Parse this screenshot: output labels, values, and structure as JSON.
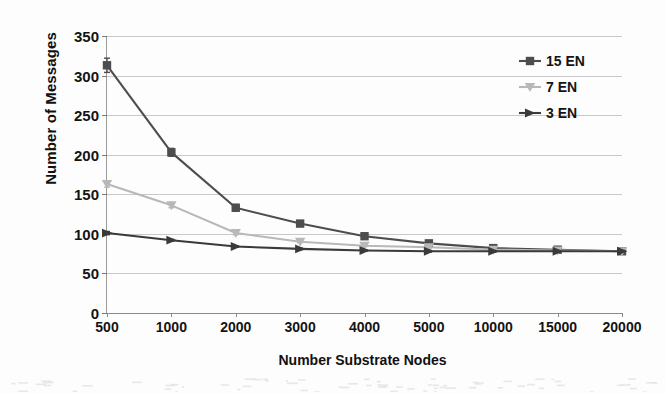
{
  "chart_data": {
    "type": "line",
    "title": "",
    "xlabel": "Number Substrate Nodes",
    "ylabel": "Number of Messages",
    "categories": [
      "500",
      "1000",
      "2000",
      "3000",
      "4000",
      "5000",
      "10000",
      "15000",
      "20000"
    ],
    "ylim": [
      0,
      350
    ],
    "yticks": [
      "0",
      "50",
      "100",
      "150",
      "200",
      "250",
      "300",
      "350"
    ],
    "grid": true,
    "legend_position": "top-right-inside",
    "series": [
      {
        "name": "15 EN",
        "color": "#4d4d4d",
        "marker": "square",
        "values": [
          313,
          203,
          133,
          113,
          97,
          88,
          82,
          80,
          78
        ]
      },
      {
        "name": "7 EN",
        "color": "#b8b8b8",
        "marker": "triangle-down",
        "values": [
          163,
          136,
          101,
          90,
          85,
          83,
          80,
          79,
          78
        ]
      },
      {
        "name": "3 EN",
        "color": "#3a3a3a",
        "marker": "triangle-right",
        "values": [
          101,
          92,
          84,
          81,
          79,
          78,
          78,
          78,
          78
        ]
      }
    ],
    "error_bars": {
      "15 EN": [
        9,
        5,
        4,
        2,
        2,
        1,
        1,
        1,
        1
      ],
      "7 EN": [
        4,
        3,
        2,
        1,
        1,
        1,
        1,
        1,
        1
      ],
      "3 EN": [
        2,
        1,
        1,
        1,
        1,
        1,
        1,
        1,
        1
      ]
    }
  },
  "legend": {
    "items": [
      {
        "label": "15 EN",
        "marker": "square",
        "color": "#4d4d4d"
      },
      {
        "label": "7 EN",
        "marker": "triangle-down",
        "color": "#b8b8b8"
      },
      {
        "label": "3 EN",
        "marker": "triangle-right",
        "color": "#3a3a3a"
      }
    ]
  }
}
